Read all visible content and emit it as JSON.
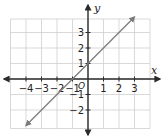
{
  "chart_data": {
    "type": "line",
    "title": "",
    "xlabel": "x",
    "ylabel": "y",
    "origin_label": "O",
    "xlim": [
      -5,
      4
    ],
    "ylim": [
      -3,
      4
    ],
    "grid": true,
    "x_ticks": [
      -4,
      -3,
      -2,
      -1,
      1,
      2,
      3
    ],
    "y_ticks": [
      -2,
      -1,
      1,
      2,
      3
    ],
    "x_tick_labels": [
      "−4",
      "−3",
      "−2",
      "−1",
      "1",
      "2",
      "3"
    ],
    "y_tick_labels": [
      "−2",
      "−1",
      "1",
      "2",
      "3"
    ],
    "series": [
      {
        "name": "y = x + 1",
        "equation": "y = x + 1",
        "slope": 1,
        "intercept": 1,
        "x": [
          -4,
          3
        ],
        "y": [
          -3,
          4
        ],
        "arrows_both_ends": true,
        "color": "#7a7a7a"
      }
    ]
  },
  "colors": {
    "grid": "#cfcfcf",
    "axis": "#2b2b2b",
    "line": "#7a7a7a",
    "text": "#222222"
  }
}
